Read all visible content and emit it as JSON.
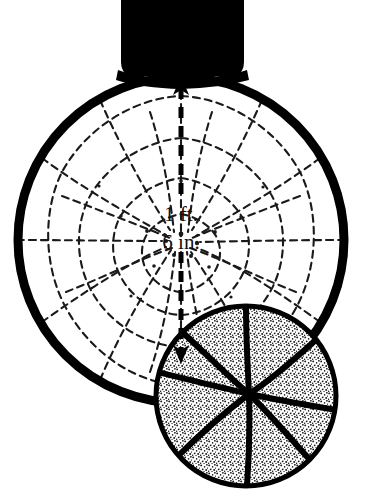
{
  "figure": {
    "background_color": "#ffffff",
    "ink_color": "#000000",
    "width": 373,
    "height": 499
  },
  "annotation": {
    "line1": "1 ft.",
    "line2": "6 in.",
    "full_text": "1 ft. 6 in.",
    "measures": "hoop-rim-inside-diameter"
  },
  "parts": {
    "backboard_post": {
      "name": "backboard-post",
      "fill": "#000000",
      "x": 121,
      "y": 0,
      "width": 123,
      "height": 78
    },
    "rim": {
      "name": "hoop-rim",
      "center_x": 181,
      "center_y": 240,
      "radius": 167,
      "stroke_width": 9,
      "stroke": "#000000"
    },
    "net": {
      "name": "hoop-net",
      "style": "dashed-radial-mesh",
      "strands": 12,
      "rings": 4,
      "stroke": "#1a1a1a"
    },
    "dimension_arrow": {
      "name": "dimension-arrow",
      "x": 181,
      "top_y": 78,
      "bottom_y": 362,
      "style": "dashed",
      "double_headed": true,
      "stroke": "#000000"
    },
    "basketball": {
      "name": "basketball",
      "center_x": 246,
      "center_y": 396,
      "radius": 91,
      "fill": "stippled",
      "seams": 6,
      "stroke": "#000000"
    }
  }
}
